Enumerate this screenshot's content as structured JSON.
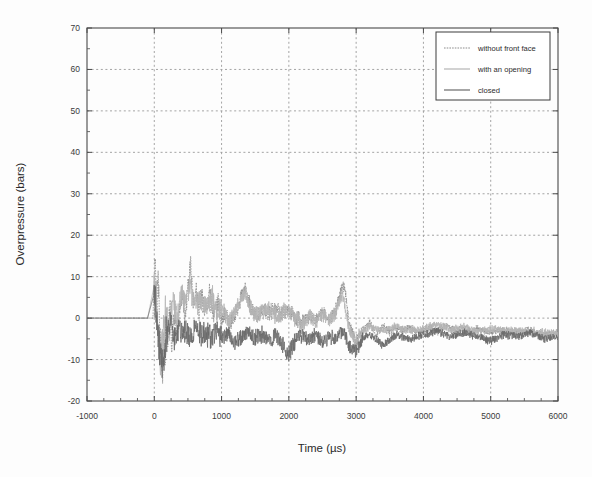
{
  "chart_data": {
    "type": "line",
    "title": "",
    "xlabel": "Time (µs)",
    "ylabel": "Overpressure (bars)",
    "xlim": [
      -1000,
      6000
    ],
    "ylim": [
      -20,
      70
    ],
    "xticks": [
      -1000,
      0,
      1000,
      2000,
      3000,
      4000,
      5000,
      6000
    ],
    "xtick_labels": [
      "-1000",
      "0",
      "1000",
      "2000",
      "3000",
      "4000",
      "5000",
      "6000"
    ],
    "yticks": [
      -20,
      -10,
      0,
      10,
      20,
      30,
      40,
      50,
      60,
      70
    ],
    "ytick_labels": [
      "-20",
      "-10",
      "0",
      "10",
      "20",
      "30",
      "40",
      "50",
      "60",
      "70"
    ],
    "x_minor_tick_step": 250,
    "y_minor_tick_step": 5,
    "grid": true,
    "grid_style": "dotted",
    "grid_color": "#9a9a9a",
    "frame_color": "#4a4a4a",
    "legend_position": "top-right",
    "series": [
      {
        "name": "without front face",
        "style": "dotted",
        "color": "#8c8c8c",
        "x": [
          -1000,
          -200,
          -60,
          -20,
          0,
          20,
          40,
          60,
          80,
          100,
          120,
          140,
          160,
          180,
          200,
          230,
          260,
          300,
          340,
          380,
          420,
          460,
          500,
          540,
          580,
          620,
          660,
          700,
          760,
          820,
          880,
          940,
          1000,
          1060,
          1120,
          1180,
          1240,
          1300,
          1350,
          1400,
          1460,
          1520,
          1600,
          1700,
          1800,
          1900,
          2000,
          2100,
          2200,
          2300,
          2400,
          2500,
          2600,
          2700,
          2800,
          2850,
          2900,
          3000,
          3100,
          3200,
          3300,
          3400,
          3500,
          3600,
          3700,
          3800,
          3900,
          4000,
          4100,
          4200,
          4300,
          4400,
          4500,
          4600,
          4700,
          4800,
          4900,
          5000,
          5200,
          5400,
          5600,
          5800,
          6000
        ],
        "y": [
          0,
          0,
          0,
          0,
          10.2,
          12.0,
          2.0,
          8.0,
          -3.0,
          -9.0,
          -14.5,
          -6.0,
          -10.0,
          1.0,
          -5.0,
          3.0,
          -6.0,
          2.0,
          -4.5,
          3.5,
          5.5,
          1.0,
          7.0,
          12.0,
          4.0,
          6.5,
          2.0,
          5.5,
          1.5,
          6.0,
          0.5,
          3.5,
          0.0,
          1.0,
          -1.5,
          0.5,
          2.0,
          5.5,
          7.5,
          4.0,
          2.0,
          0.5,
          2.0,
          1.5,
          2.5,
          1.0,
          2.0,
          0.0,
          -1.0,
          0.5,
          -0.5,
          1.5,
          0.0,
          2.0,
          8.5,
          5.0,
          -2.0,
          -6.0,
          -3.0,
          -1.0,
          -4.0,
          -2.0,
          -3.5,
          -2.5,
          -3.0,
          -2.0,
          -3.5,
          -3.0,
          -2.5,
          -3.5,
          -1.5,
          -2.5,
          -3.0,
          -2.0,
          -3.5,
          -2.5,
          -3.0,
          -3.5,
          -3.0,
          -3.5,
          -3.0,
          -4.0,
          -3.5
        ]
      },
      {
        "name": "with an opening",
        "style": "solid",
        "color": "#b4b4b4",
        "x": [
          -1000,
          -100,
          0,
          30,
          60,
          100,
          140,
          180,
          220,
          280,
          340,
          400,
          460,
          520,
          580,
          640,
          700,
          780,
          860,
          940,
          1020,
          1100,
          1180,
          1260,
          1340,
          1420,
          1500,
          1600,
          1700,
          1800,
          1900,
          2000,
          2100,
          2200,
          2300,
          2400,
          2500,
          2600,
          2700,
          2800,
          2900,
          3000,
          3200,
          3400,
          3600,
          3800,
          4000,
          4200,
          4400,
          4600,
          4800,
          5000,
          5200,
          5400,
          5600,
          5800,
          6000
        ],
        "y": [
          0,
          0,
          8.0,
          4.0,
          -6.0,
          -11.0,
          -2.0,
          2.0,
          -3.0,
          4.0,
          -1.0,
          6.0,
          3.0,
          8.0,
          5.0,
          3.5,
          4.5,
          2.0,
          5.0,
          1.0,
          2.5,
          -1.0,
          1.5,
          3.0,
          6.0,
          3.0,
          0.5,
          1.5,
          2.5,
          0.5,
          1.5,
          2.0,
          0.0,
          -2.0,
          0.5,
          -1.0,
          1.0,
          -0.5,
          1.5,
          5.5,
          -3.0,
          -5.0,
          -2.0,
          -3.0,
          -2.0,
          -3.0,
          -2.5,
          -1.5,
          -3.0,
          -2.0,
          -3.5,
          -2.5,
          -3.0,
          -3.0,
          -3.5,
          -3.5,
          -4.0
        ]
      },
      {
        "name": "closed",
        "style": "solid",
        "color": "#6a6a6a",
        "x": [
          -1000,
          -100,
          0,
          40,
          80,
          120,
          180,
          240,
          300,
          360,
          420,
          480,
          540,
          600,
          680,
          760,
          840,
          920,
          1000,
          1100,
          1200,
          1300,
          1400,
          1500,
          1600,
          1700,
          1800,
          1900,
          2000,
          2100,
          2200,
          2300,
          2400,
          2500,
          2600,
          2700,
          2800,
          2900,
          3000,
          3100,
          3200,
          3400,
          3600,
          3800,
          4000,
          4200,
          4400,
          4600,
          4800,
          5000,
          5200,
          5400,
          5600,
          5800,
          6000
        ],
        "y": [
          0,
          0,
          6.0,
          -2.0,
          -8.0,
          -12.0,
          -4.0,
          -1.0,
          -5.0,
          -2.0,
          -4.5,
          -3.0,
          -5.0,
          -2.5,
          -4.0,
          -3.5,
          -5.0,
          -3.0,
          -4.5,
          -4.0,
          -6.0,
          -4.5,
          -3.5,
          -5.0,
          -4.0,
          -5.5,
          -4.5,
          -6.5,
          -9.0,
          -5.0,
          -4.0,
          -5.5,
          -4.0,
          -6.0,
          -4.5,
          -5.0,
          -3.0,
          -7.0,
          -8.0,
          -5.0,
          -4.0,
          -6.5,
          -4.0,
          -5.0,
          -4.0,
          -3.0,
          -4.5,
          -3.5,
          -4.5,
          -5.5,
          -4.0,
          -4.5,
          -3.5,
          -5.0,
          -4.5
        ]
      }
    ]
  },
  "legend": {
    "entries": [
      {
        "label": "without front face"
      },
      {
        "label": "with an opening"
      },
      {
        "label": "closed"
      }
    ]
  }
}
